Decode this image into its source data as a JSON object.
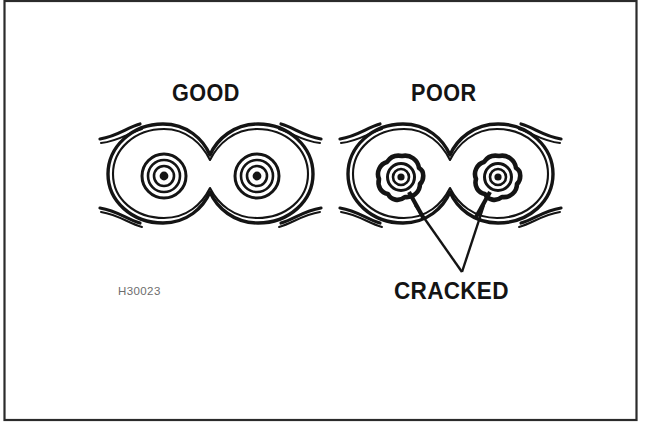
{
  "figure": {
    "reference_number": "H30023",
    "background_color": "#ffffff",
    "ink_color": "#141414",
    "frame_color": "#2b2b2b",
    "reference_color": "#6d6d6d",
    "panels": [
      {
        "id": "good",
        "label": "GOOD",
        "condition": "undamaged",
        "roller_count": 2,
        "roller_description": "clean concentric rings with solid center pin"
      },
      {
        "id": "poor",
        "label": "POOR",
        "condition": "damaged",
        "roller_count": 2,
        "roller_description": "thickened irregular rings with fracture lines"
      }
    ],
    "callout": {
      "label": "CRACKED",
      "leader_count": 2,
      "points_to": "roller bores on the POOR chain link"
    }
  }
}
